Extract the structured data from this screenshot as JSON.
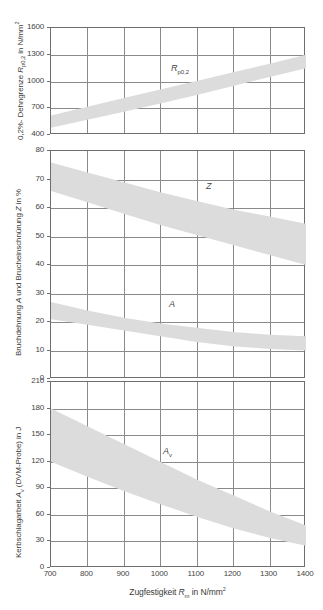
{
  "figure": {
    "xaxis": {
      "label_plain": "Zugfestigkeit Rm in N/mm2",
      "label_prefix": "Zugfestigkeit ",
      "label_symbol": "R",
      "label_symbol_sub": "m",
      "label_suffix": " in N/mm",
      "label_sup": "2",
      "min": 700,
      "max": 1400,
      "ticks": [
        700,
        800,
        900,
        1000,
        1100,
        1200,
        1300,
        1400
      ],
      "ticklabels": [
        "700",
        "800",
        "900",
        "1000",
        "1100",
        "1200",
        "1300",
        "1400"
      ],
      "grid": true
    },
    "panels": [
      {
        "id": "panel-rp02",
        "ylabel_plain": "0,2%-Dehngrenze Rp0,2 in N/mm2",
        "ylabel_prefix": "0,2%- Dehngrenze ",
        "ylabel_symbol": "R",
        "ylabel_symbol_sub": "p0,2",
        "ylabel_suffix": " in N/mm",
        "ylabel_sup": "2",
        "ymin": 400,
        "ymax": 1600,
        "yticks": [
          400,
          700,
          1000,
          1300,
          1600
        ],
        "yticklabels": [
          "400",
          "700",
          "1000",
          "1300",
          "1600"
        ],
        "grid": true,
        "curve_label": "Rp0,2",
        "curve_label_symbol": "R",
        "curve_label_sub": "p0,2"
      },
      {
        "id": "panel-a-z",
        "ylabel_plain": "Bruchdehnung A und Brucheinschnurung Z in %",
        "ylabel_prefix": "Bruchdehnung ",
        "ylabel_symbol": "A",
        "ylabel_mid": " und Brucheinschnürung ",
        "ylabel_symbol2": "Z",
        "ylabel_suffix": " in %",
        "ymin": 0,
        "ymax": 80,
        "yticks": [
          0,
          10,
          20,
          30,
          40,
          50,
          60,
          70,
          80
        ],
        "yticklabels": [
          "0",
          "10",
          "20",
          "30",
          "40",
          "50",
          "60",
          "70",
          "80"
        ],
        "grid": true,
        "curve_label_z": "Z",
        "curve_label_a": "A"
      },
      {
        "id": "panel-av",
        "ylabel_plain": "Kerbschlagarbeit Av (DVM-Probe) in J",
        "ylabel_prefix": "Kerbschlagarbeit ",
        "ylabel_symbol": "A",
        "ylabel_symbol_sub": "v",
        "ylabel_suffix": " (DVM-Probe) in J",
        "ymin": 0,
        "ymax": 210,
        "yticks": [
          0,
          30,
          60,
          90,
          120,
          150,
          180,
          210
        ],
        "yticklabels": [
          "0",
          "30",
          "60",
          "90",
          "120",
          "150",
          "180",
          "210"
        ],
        "grid": true,
        "curve_label": "Av",
        "curve_label_symbol": "A",
        "curve_label_sub": "v"
      }
    ]
  },
  "chart_data": [
    {
      "type": "area",
      "name": "0.2% proof strength band",
      "title": "",
      "xlabel": "Zugfestigkeit Rm in N/mm2",
      "ylabel": "0,2%-Dehngrenze Rp0,2 in N/mm2",
      "xlim": [
        700,
        1400
      ],
      "ylim": [
        400,
        1600
      ],
      "grid": true,
      "legend": "Rp0,2",
      "x": [
        700,
        800,
        900,
        1000,
        1100,
        1200,
        1300,
        1400
      ],
      "series": [
        {
          "name": "Rp0,2 upper",
          "values": [
            620,
            718,
            815,
            910,
            1005,
            1103,
            1200,
            1300
          ]
        },
        {
          "name": "Rp0,2 lower",
          "values": [
            480,
            570,
            660,
            752,
            848,
            950,
            1050,
            1150
          ]
        }
      ]
    },
    {
      "type": "area",
      "name": "Elongation and reduction of area bands",
      "title": "",
      "xlabel": "Zugfestigkeit Rm in N/mm2",
      "ylabel": "Bruchdehnung A und Brucheinschnurung Z in %",
      "xlim": [
        700,
        1400
      ],
      "ylim": [
        0,
        80
      ],
      "grid": true,
      "legend": "Z, A",
      "x": [
        700,
        800,
        900,
        1000,
        1100,
        1200,
        1300,
        1400
      ],
      "series": [
        {
          "name": "Z upper",
          "values": [
            76,
            72.5,
            69,
            65.5,
            62.5,
            59.5,
            57,
            54.5
          ]
        },
        {
          "name": "Z lower",
          "values": [
            66,
            62,
            58,
            54,
            50.5,
            47,
            43.5,
            40
          ]
        },
        {
          "name": "A upper",
          "values": [
            27,
            24,
            21.5,
            19.5,
            18,
            16.5,
            15.5,
            15
          ]
        },
        {
          "name": "A lower",
          "values": [
            21,
            19,
            17,
            15,
            13,
            11.5,
            10.5,
            10
          ]
        }
      ]
    },
    {
      "type": "area",
      "name": "Impact energy band (DVM specimen)",
      "title": "",
      "xlabel": "Zugfestigkeit Rm in N/mm2",
      "ylabel": "Kerbschlagarbeit Av (DVM-Probe) in J",
      "xlim": [
        700,
        1400
      ],
      "ylim": [
        0,
        210
      ],
      "grid": true,
      "legend": "Av",
      "x": [
        700,
        800,
        900,
        1000,
        1100,
        1200,
        1300,
        1400
      ],
      "series": [
        {
          "name": "Av upper",
          "values": [
            180,
            160,
            140,
            120,
            100,
            82,
            64,
            48
          ]
        },
        {
          "name": "Av lower",
          "values": [
            120,
            103,
            87,
            72,
            58,
            45,
            34,
            25
          ]
        }
      ]
    }
  ],
  "style": {
    "band_fill": "#dcdcdc",
    "grid_color": "#8a8a8a",
    "frame_color": "#6e6e6e",
    "text_color": "#3a3a3a",
    "background": "#ffffff"
  }
}
